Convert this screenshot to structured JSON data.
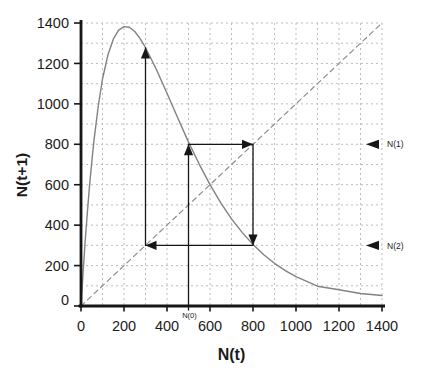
{
  "figure": {
    "background": "#ffffff",
    "colors": {
      "axis": "#161616",
      "text": "#1b1b1b"
    }
  },
  "chart_data": {
    "type": "line",
    "title": "",
    "xlabel": "N(t)",
    "ylabel": "N(t+1)",
    "xlim": [
      0,
      1400
    ],
    "ylim": [
      0,
      1400
    ],
    "xticks": [
      0,
      200,
      400,
      600,
      800,
      1000,
      1200,
      1400
    ],
    "yticks": [
      0,
      200,
      400,
      600,
      800,
      1000,
      1200,
      1400
    ],
    "grid": {
      "show": true,
      "step": 100,
      "style": "dashed",
      "color": "#bdbdbd"
    },
    "legend": "none",
    "series": [
      {
        "name": "reproduction curve N(t+1)=f(N(t))",
        "style": "solid",
        "color": "#828282",
        "points": [
          [
            0,
            0
          ],
          [
            10,
            173
          ],
          [
            20,
            330
          ],
          [
            30,
            471
          ],
          [
            40,
            599
          ],
          [
            50,
            713
          ],
          [
            60,
            816
          ],
          [
            80,
            987
          ],
          [
            100,
            1123
          ],
          [
            125,
            1241
          ],
          [
            150,
            1320
          ],
          [
            175,
            1365
          ],
          [
            200,
            1382
          ],
          [
            225,
            1379
          ],
          [
            250,
            1358
          ],
          [
            275,
            1323
          ],
          [
            300,
            1279
          ],
          [
            350,
            1171
          ],
          [
            400,
            1052
          ],
          [
            450,
            930
          ],
          [
            500,
            811
          ],
          [
            550,
            701
          ],
          [
            600,
            600
          ],
          [
            650,
            510
          ],
          [
            700,
            431
          ],
          [
            750,
            363
          ],
          [
            800,
            304
          ],
          [
            850,
            254
          ],
          [
            900,
            211
          ],
          [
            950,
            175
          ],
          [
            1000,
            145
          ],
          [
            1100,
            98
          ],
          [
            1200,
            80
          ],
          [
            1300,
            62
          ],
          [
            1400,
            52
          ]
        ]
      },
      {
        "name": "replacement line N(t+1)=N(t)",
        "style": "dashed",
        "color": "#8f8f8f",
        "points": [
          [
            0,
            0
          ],
          [
            1400,
            1400
          ]
        ]
      }
    ],
    "cobweb": {
      "color": "#161616",
      "path": [
        [
          500,
          0
        ],
        [
          500,
          800
        ],
        [
          800,
          800
        ],
        [
          800,
          300
        ],
        [
          300,
          300
        ],
        [
          300,
          1279
        ]
      ],
      "arrows": [
        {
          "at": [
            500,
            800
          ],
          "dir": "up"
        },
        {
          "at": [
            800,
            800
          ],
          "dir": "right"
        },
        {
          "at": [
            800,
            300
          ],
          "dir": "down"
        },
        {
          "at": [
            300,
            300
          ],
          "dir": "left"
        },
        {
          "at": [
            300,
            1279
          ],
          "dir": "up"
        }
      ],
      "iterates": {
        "N0": 500,
        "N1": 800,
        "N2": 300,
        "N3": 1279
      }
    },
    "annotations": [
      {
        "label": "N(0)",
        "position": "below-x-axis",
        "x": 500
      },
      {
        "label": "N(1)",
        "position": "right-margin",
        "y": 800,
        "marker": "left-arrow"
      },
      {
        "label": "N(2)",
        "position": "right-margin",
        "y": 300,
        "marker": "left-arrow"
      }
    ],
    "key_points": {
      "equilibrium": 600,
      "curve_peak": [
        210,
        1380
      ]
    }
  }
}
